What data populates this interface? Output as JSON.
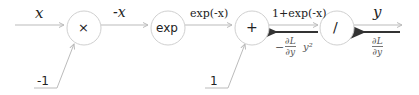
{
  "diagram": {
    "nodes": [
      {
        "id": "mul",
        "label": "×"
      },
      {
        "id": "exp",
        "label": "exp"
      },
      {
        "id": "add",
        "label": "+"
      },
      {
        "id": "div",
        "label": "/"
      }
    ],
    "edge_labels": {
      "x": "x",
      "neg_x": "-x",
      "exp_neg_x": "exp(-x)",
      "one_plus_exp": "1+exp(-x)",
      "y": "y"
    },
    "constants": {
      "minus_one": "-1",
      "one": "1"
    },
    "gradients": {
      "upstream": {
        "numerator": "∂L",
        "denominator": "∂y"
      },
      "downstream": {
        "sign": "−",
        "numerator": "∂L",
        "denominator": "∂y",
        "factor": "y²"
      }
    },
    "colors": {
      "forward_line": "#bbbbbb",
      "backward_arrow": "#333333",
      "node_stroke": "#d0d0d0"
    }
  }
}
